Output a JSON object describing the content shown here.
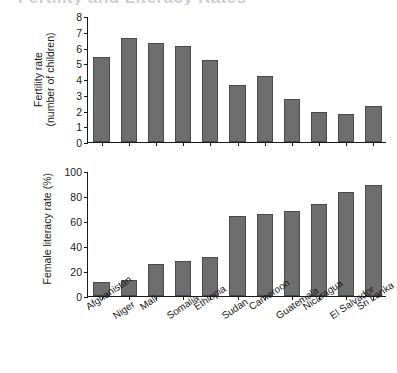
{
  "figure": {
    "title_clipped": "Fertility and Literacy Rates",
    "bar_color": "#6e6e6e",
    "bar_edge_color": "#4a4a4a",
    "axis_color": "#1a1a1a",
    "background": "#ffffff"
  },
  "chart_data": [
    {
      "type": "bar",
      "title": "",
      "panel": "top",
      "xlabel": "",
      "ylabel": "Fertility rate\n(number of children)",
      "ylabel_line1": "Fertility rate",
      "ylabel_line2": "(number of children)",
      "ylim": [
        0,
        8
      ],
      "yticks": [
        0,
        1,
        2,
        3,
        4,
        5,
        6,
        7,
        8
      ],
      "ytick_labels": [
        "0",
        "1",
        "2",
        "3",
        "4",
        "5",
        "6",
        "7",
        "8"
      ],
      "grid": false,
      "legend": null,
      "categories": [
        "Afghanistan",
        "Niger",
        "Mali",
        "Somalia",
        "Ethiopia",
        "Sudan",
        "Cameroon",
        "Guatemala",
        "Nicaragua",
        "El Salvador",
        "Sri Lanka"
      ],
      "values": [
        5.4,
        6.6,
        6.3,
        6.1,
        5.2,
        3.6,
        4.2,
        2.7,
        1.9,
        1.8,
        2.3
      ]
    },
    {
      "type": "bar",
      "title": "",
      "panel": "bottom",
      "xlabel": "",
      "ylabel": "Female literacy rate (%)",
      "ylim": [
        0,
        100
      ],
      "yticks": [
        0,
        20,
        40,
        60,
        80,
        100
      ],
      "ytick_labels": [
        "0",
        "20",
        "40",
        "60",
        "80",
        "100"
      ],
      "grid": false,
      "legend": null,
      "categories": [
        "Afghanistan",
        "Niger",
        "Mali",
        "Somalia",
        "Ethiopia",
        "Sudan",
        "Cameroon",
        "Guatemala",
        "Nicaragua",
        "El Salvador",
        "Sri Lanka"
      ],
      "values": [
        11,
        13,
        26,
        28,
        31,
        64,
        66,
        68,
        74,
        83,
        89
      ]
    }
  ]
}
